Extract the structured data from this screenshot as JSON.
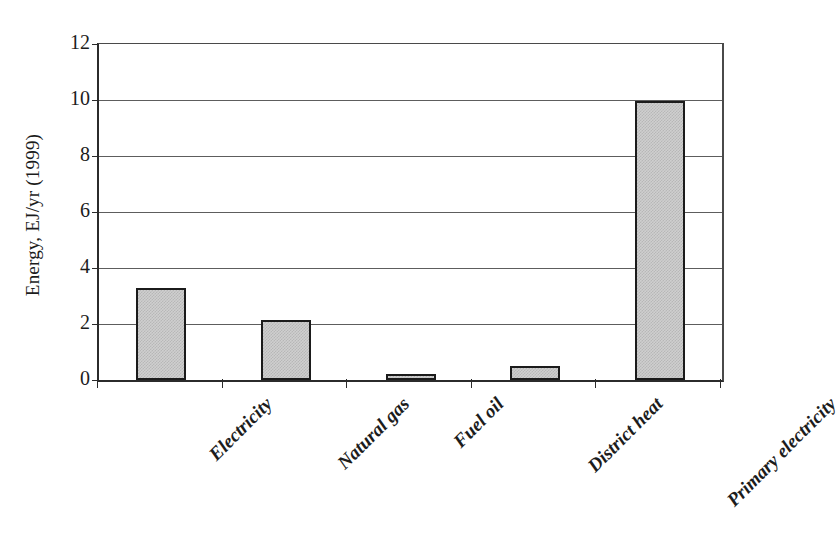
{
  "chart_data": {
    "type": "bar",
    "title": "",
    "subtitle": "",
    "xlabel": "",
    "ylabel": "Energy, EJ/yr (1999)",
    "categories": [
      "Electricity",
      "Natural gas",
      "Fuel oil",
      "District heat",
      "Primary electricity"
    ],
    "values": [
      3.3,
      2.15,
      0.2,
      0.5,
      9.95
    ],
    "series": [
      {
        "name": "Energy",
        "values": [
          3.3,
          2.15,
          0.2,
          0.5,
          9.95
        ]
      }
    ],
    "ylim": [
      0,
      12
    ],
    "ytick_values": [
      0,
      2,
      4,
      6,
      8,
      10,
      12
    ],
    "ytick_labels": [
      "0",
      "2",
      "4",
      "6",
      "8",
      "10",
      "12"
    ],
    "grid": "horizontal",
    "legend": "none",
    "bar_fill_color": "#cfcfcf",
    "bar_border_color": "#1b1b1b",
    "gridline_color": "#5d5d5d",
    "axis_color": "#2b2b2b",
    "background_color": "#ffffff",
    "xlabel_rotation_degrees": 45,
    "annotations": []
  }
}
